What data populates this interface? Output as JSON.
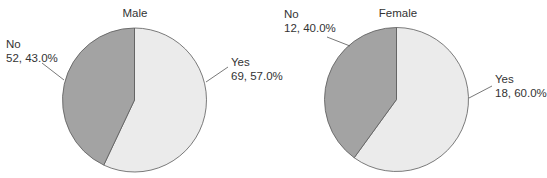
{
  "chart_data": [
    {
      "type": "pie",
      "title": "Male",
      "categories": [
        "Yes",
        "No"
      ],
      "values": [
        69,
        52
      ],
      "percentages": [
        57.0,
        43.0
      ],
      "labels": [
        "69, 57.0%",
        "52, 43.0%"
      ],
      "colors": [
        "#ebebeb",
        "#a3a3a3"
      ],
      "legend": "none"
    },
    {
      "type": "pie",
      "title": "Female",
      "categories": [
        "Yes",
        "No"
      ],
      "values": [
        18,
        12
      ],
      "percentages": [
        60.0,
        40.0
      ],
      "labels": [
        "18, 60.0%",
        "12, 40.0%"
      ],
      "colors": [
        "#ebebeb",
        "#a3a3a3"
      ],
      "legend": "none"
    }
  ],
  "charts": {
    "male": {
      "title": "Male",
      "yes": {
        "name": "Yes",
        "value_label": "69, 57.0%"
      },
      "no": {
        "name": "No",
        "value_label": "52, 43.0%"
      }
    },
    "female": {
      "title": "Female",
      "yes": {
        "name": "Yes",
        "value_label": "18, 60.0%"
      },
      "no": {
        "name": "No",
        "value_label": "12, 40.0%"
      }
    }
  },
  "style": {
    "yes_color": "#ebebeb",
    "no_color": "#a3a3a3",
    "outline_color": "#5a5a5a"
  }
}
